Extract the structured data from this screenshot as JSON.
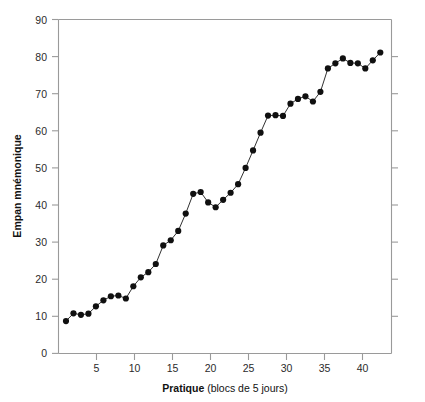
{
  "chart_data": {
    "type": "line",
    "title": "",
    "subtitle": "",
    "xlabel_bold": "Pratique",
    "xlabel_rest": " (blocs de 5 jours)",
    "xlabel": "Pratique (blocs de 5 jours)",
    "ylabel": "Empan mnémonique",
    "xlim": [
      0,
      44.5
    ],
    "ylim": [
      0,
      90
    ],
    "xticks": [
      5,
      10,
      15,
      20,
      25,
      30,
      35,
      40
    ],
    "xtick_labels": [
      "5",
      "10",
      "15",
      "20",
      "25",
      "30",
      "35",
      "40"
    ],
    "yticks": [
      0,
      10,
      20,
      30,
      40,
      50,
      60,
      70,
      80,
      90
    ],
    "ytick_labels": [
      "0",
      "10",
      "20",
      "30",
      "40",
      "50",
      "60",
      "70",
      "80",
      "90"
    ],
    "grid": false,
    "legend": null,
    "marker": "filled-circle",
    "line_color": "#1a1a1a",
    "marker_color": "#101010",
    "axis_color": "#9a9a9a",
    "x": [
      1,
      2,
      3,
      4,
      5,
      6,
      7,
      8,
      9,
      10,
      11,
      12,
      13,
      14,
      15,
      16,
      17,
      18,
      19,
      20,
      21,
      22,
      23,
      24,
      25,
      26,
      27,
      28,
      29,
      30,
      31,
      32,
      33,
      34,
      35,
      36,
      37,
      38,
      39,
      40,
      41,
      42,
      43
    ],
    "values": [
      8.7,
      10.8,
      10.4,
      10.7,
      12.7,
      14.3,
      15.4,
      15.6,
      14.8,
      18.1,
      20.5,
      21.9,
      24.1,
      29.1,
      30.5,
      33.0,
      37.7,
      43.0,
      43.5,
      40.7,
      39.4,
      41.4,
      43.3,
      45.6,
      50.0,
      54.7,
      59.5,
      64.1,
      64.2,
      64.0,
      67.3,
      68.6,
      69.3,
      67.9,
      70.5,
      76.8,
      78.2,
      79.5,
      78.3,
      78.2,
      76.8,
      79.0,
      81.1
    ],
    "series": [
      {
        "name": "Empan mnémonique",
        "values": [
          8.7,
          10.8,
          10.4,
          10.7,
          12.7,
          14.3,
          15.4,
          15.6,
          14.8,
          18.1,
          20.5,
          21.9,
          24.1,
          29.1,
          30.5,
          33.0,
          37.7,
          43.0,
          43.5,
          40.7,
          39.4,
          41.4,
          43.3,
          45.6,
          50.0,
          54.7,
          59.5,
          64.1,
          64.2,
          64.0,
          67.3,
          68.6,
          69.3,
          67.9,
          70.5,
          76.8,
          78.2,
          79.5,
          78.3,
          78.2,
          76.8,
          79.0,
          81.1
        ]
      }
    ]
  }
}
